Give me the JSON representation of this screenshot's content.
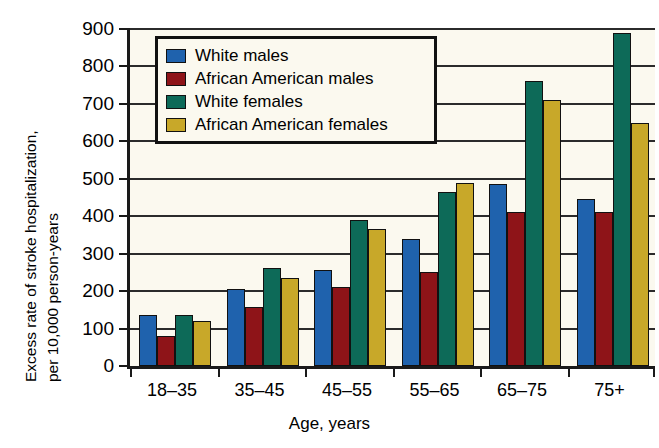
{
  "chart_data": {
    "type": "bar",
    "title": "",
    "xlabel": "Age, years",
    "ylabel": "Excess rate of stroke hospitalization, per 10,000 person-years",
    "ylabel_line1": "Excess rate of stroke hospitalization,",
    "ylabel_line2": "per 10,000 person-years",
    "categories": [
      "18–35",
      "35–45",
      "45–55",
      "55–65",
      "65–75",
      "75+"
    ],
    "ylim": [
      0,
      900
    ],
    "yticks": [
      0,
      100,
      200,
      300,
      400,
      500,
      600,
      700,
      800,
      900
    ],
    "ytick_labels": [
      "0",
      "100",
      "200",
      "300",
      "400",
      "500",
      "600",
      "700",
      "800",
      "900"
    ],
    "grid": "horizontal",
    "legend_position": "upper-left-inside",
    "series": [
      {
        "name": "White males",
        "color": "#1f62ad",
        "values": [
          135,
          205,
          256,
          340,
          485,
          445
        ]
      },
      {
        "name": "African American males",
        "color": "#8e1418",
        "values": [
          80,
          157,
          210,
          252,
          412,
          410
        ]
      },
      {
        "name": "White females",
        "color": "#0d6a58",
        "values": [
          137,
          262,
          390,
          465,
          760,
          890
        ]
      },
      {
        "name": "African American females",
        "color": "#c8a829",
        "values": [
          120,
          235,
          367,
          488,
          710,
          650
        ]
      }
    ]
  },
  "figure": {
    "background": "#ffffff",
    "plot_background": "#fbf9ef",
    "axis_color": "#1a1a1a",
    "grid_color": "#2b2b2b",
    "bar_edge_color": "#111111"
  }
}
